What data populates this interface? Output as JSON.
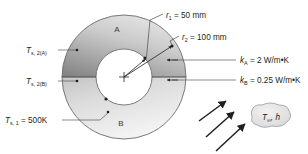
{
  "figure": {
    "background_color": "#ffffff"
  },
  "geometry": {
    "center_x": 124,
    "center_y": 77,
    "inner_radius_px": 28,
    "outer_radius_px": 62
  },
  "regions": [
    {
      "id": "A",
      "label": "A",
      "position": "upper-half",
      "fill_dark": "#8e8e8e",
      "fill_light": "#d9d9d9"
    },
    {
      "id": "B",
      "label": "B",
      "position": "lower-half",
      "fill_dark": "#c9c9c9",
      "fill_light": "#f2f2f2"
    }
  ],
  "dimension_labels": [
    {
      "id": "r1",
      "symbol": "r",
      "subscript": "1",
      "equals": " = 50 mm",
      "text": "r1 = 50 mm",
      "x": 166,
      "y": 15
    },
    {
      "id": "r2",
      "symbol": "r",
      "subscript": "2",
      "equals": " = 100 mm",
      "text": "r2 = 100 mm",
      "x": 182,
      "y": 37
    }
  ],
  "conductivity_labels": [
    {
      "id": "kA",
      "symbol": "k",
      "subscript": "A",
      "equals": " = 2 W/m•K",
      "text": "kA = 2 W/m•K",
      "x": 240,
      "y": 63
    },
    {
      "id": "kB",
      "symbol": "k",
      "subscript": "B",
      "equals": " = 0.25 W/m•K",
      "text": "kB = 0.25 W/m•K",
      "x": 240,
      "y": 83
    }
  ],
  "temperature_labels": [
    {
      "id": "Ts2A",
      "symbol": "T",
      "subscript": "s, 2(A)",
      "equals": "",
      "text": "Ts, 2(A)",
      "x": 26,
      "y": 52
    },
    {
      "id": "Ts2B",
      "symbol": "T",
      "subscript": "s, 2(B)",
      "equals": "",
      "text": "Ts, 2(B)",
      "x": 26,
      "y": 83
    },
    {
      "id": "Ts1",
      "symbol": "T",
      "subscript": "s, 1",
      "equals": " = 500K",
      "text": "Ts, 1 = 500K",
      "x": 5,
      "y": 123
    }
  ],
  "convection": {
    "bubble_symbol": "T",
    "bubble_subscript": "∞",
    "bubble_rest": ", h",
    "bubble_text": "T∞, h",
    "bubble_x": 268,
    "bubble_y": 117,
    "arrow_count": 3
  },
  "colors": {
    "ink": "#231f20",
    "leader": "#58595b",
    "outline": "#6b6b6b",
    "bubble_fill": "#e8e8e8"
  }
}
